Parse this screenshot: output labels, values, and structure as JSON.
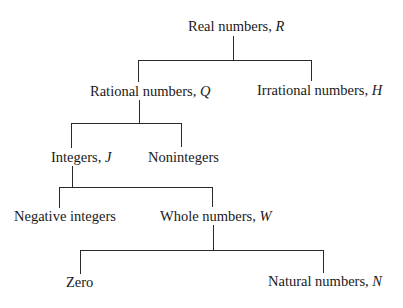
{
  "diagram": {
    "type": "tree",
    "nodes": {
      "real": {
        "label": "Real numbers, ",
        "symbol": "R"
      },
      "rational": {
        "label": "Rational numbers, ",
        "symbol": "Q"
      },
      "irrational": {
        "label": "Irrational numbers, ",
        "symbol": "H"
      },
      "integers": {
        "label": "Integers, ",
        "symbol": "J"
      },
      "nonintegers": {
        "label": "Nonintegers",
        "symbol": ""
      },
      "negative_integers": {
        "label": "Negative integers",
        "symbol": ""
      },
      "whole": {
        "label": "Whole numbers, ",
        "symbol": "W"
      },
      "zero": {
        "label": "Zero",
        "symbol": ""
      },
      "natural": {
        "label": "Natural numbers, ",
        "symbol": "N"
      }
    },
    "edges": [
      {
        "from": "real",
        "to": "rational"
      },
      {
        "from": "real",
        "to": "irrational"
      },
      {
        "from": "rational",
        "to": "integers"
      },
      {
        "from": "rational",
        "to": "nonintegers"
      },
      {
        "from": "integers",
        "to": "negative_integers"
      },
      {
        "from": "integers",
        "to": "whole"
      },
      {
        "from": "whole",
        "to": "zero"
      },
      {
        "from": "whole",
        "to": "natural"
      }
    ],
    "colors": {
      "line": "#2a2a2a",
      "text": "#1a1a1a",
      "background": "#ffffff"
    }
  }
}
